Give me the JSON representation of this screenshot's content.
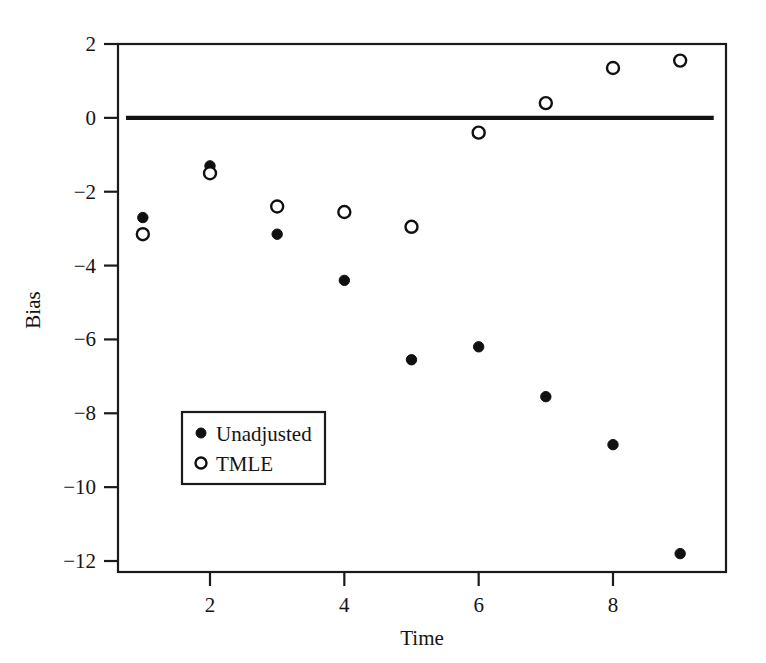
{
  "figure": {
    "background_color": "#ffffff",
    "foreground_color": "#111111"
  },
  "chart_data": {
    "type": "scatter",
    "title": "",
    "xlabel": "Time",
    "ylabel": "Bias",
    "xlim": [
      0.55,
      9.45
    ],
    "ylim": [
      -12.8,
      2.3
    ],
    "xticks": [
      2,
      4,
      6,
      8
    ],
    "yticks": [
      2,
      0,
      -2,
      -4,
      -6,
      -8,
      -10,
      -12
    ],
    "xtick_labels": [
      "2",
      "4",
      "6",
      "8"
    ],
    "ytick_labels": [
      "2",
      "0",
      "−2",
      "−4",
      "−6",
      "−8",
      "−10",
      "−12"
    ],
    "grid": false,
    "legend_position": "lower-left-inside",
    "x": [
      1,
      2,
      3,
      4,
      5,
      6,
      7,
      8,
      9
    ],
    "series": [
      {
        "name": "Unadjusted",
        "marker": "filled-circle",
        "color": "#101010",
        "values": [
          -2.7,
          -1.3,
          -3.15,
          -4.4,
          -6.55,
          -6.2,
          -7.55,
          -8.85,
          -11.8
        ]
      },
      {
        "name": "TMLE",
        "marker": "open-circle",
        "color": "#101010",
        "values": [
          -3.15,
          -1.5,
          -2.4,
          -2.55,
          -2.95,
          -0.4,
          0.4,
          1.35,
          1.55
        ]
      }
    ],
    "reference_line": {
      "name": "zero-reference-line",
      "y": 0,
      "x_start": 0.75,
      "x_end": 9.5
    },
    "legend": {
      "entries": [
        {
          "label": "Unadjusted",
          "marker": "filled-circle"
        },
        {
          "label": "TMLE",
          "marker": "open-circle"
        }
      ]
    }
  }
}
